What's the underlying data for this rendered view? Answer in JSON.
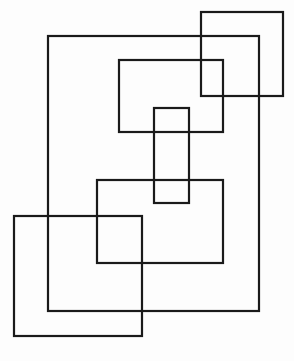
{
  "diagram": {
    "type": "overlapping-rectangles",
    "background": "#fdfdfd",
    "stroke_color": "#1a1a1a",
    "stroke_width": 2.2,
    "shapes": [
      {
        "id": "top-right-square",
        "x": 201,
        "y": 12,
        "w": 82,
        "h": 84
      },
      {
        "id": "large-outer-rectangle",
        "x": 48,
        "y": 36,
        "w": 211,
        "h": 275
      },
      {
        "id": "upper-middle-rectangle",
        "x": 119,
        "y": 60,
        "w": 104,
        "h": 72
      },
      {
        "id": "narrow-vertical-rectangle",
        "x": 154,
        "y": 108,
        "w": 35,
        "h": 95
      },
      {
        "id": "lower-middle-rectangle",
        "x": 97,
        "y": 180,
        "w": 126,
        "h": 83
      },
      {
        "id": "bottom-left-square",
        "x": 14,
        "y": 216,
        "w": 128,
        "h": 120
      }
    ]
  }
}
